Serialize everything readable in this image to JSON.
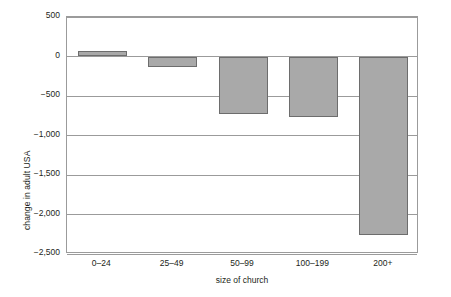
{
  "chart_data": {
    "type": "bar",
    "title": "",
    "subtitle": "",
    "xlabel": "size of church",
    "ylabel": "change in adult USA",
    "categories": [
      "0–24",
      "25–49",
      "50–99",
      "100–199",
      "200+"
    ],
    "values": [
      75,
      -135,
      -730,
      -770,
      -2260
    ],
    "series": [
      {
        "name": "change in adult USA",
        "values": [
          75,
          -135,
          -730,
          -770,
          -2260
        ]
      }
    ],
    "ylim": [
      -2500,
      500
    ],
    "ytick_values": [
      500,
      0,
      -500,
      -1000,
      -1500,
      -2000,
      -2500
    ],
    "ytick_labels": [
      "500",
      "0",
      "−500",
      "−1,000",
      "−1,500",
      "−2,000",
      "−2,500"
    ],
    "grid": true,
    "grid_axis": "y",
    "legend": false,
    "legend_position": "none",
    "bar_fill_color": "#a9a9a9",
    "bar_border_color": "#6d6d6d",
    "axis_color": "#9b9b9b",
    "text_color": "#231f20",
    "background_color": "#ffffff"
  }
}
